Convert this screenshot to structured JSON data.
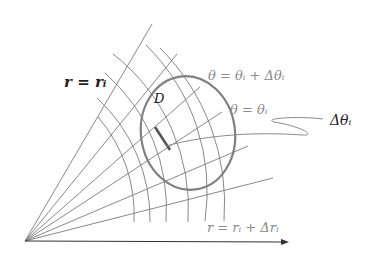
{
  "diagram": {
    "labels": {
      "r_equals_ri": "r = rᵢ",
      "region": "D",
      "theta_upper": "θ = θᵢ + Δθᵢ",
      "theta_lower": "θ = θᵢ",
      "delta_theta": "Δθᵢ",
      "r_upper": "r = rᵢ + Δrᵢ"
    },
    "colors": {
      "grid_line": "#7a7a7a",
      "region_boundary": "#808080",
      "highlight_segment": "#555555",
      "axis": "#333333",
      "label_dark": "#222222",
      "label_gray": "#8a8a8a"
    }
  }
}
